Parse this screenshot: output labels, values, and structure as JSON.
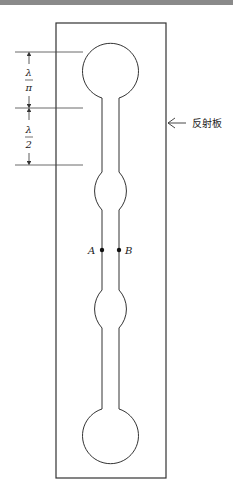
{
  "diagram": {
    "reflector_label": "反射板",
    "point_labels": {
      "a": "A",
      "b": "B"
    },
    "dimensions": [
      {
        "numerator": "λ",
        "denominator": "π"
      },
      {
        "numerator": "λ",
        "denominator": "2"
      }
    ],
    "stroke_color": "#333333",
    "circle_count": 4
  }
}
